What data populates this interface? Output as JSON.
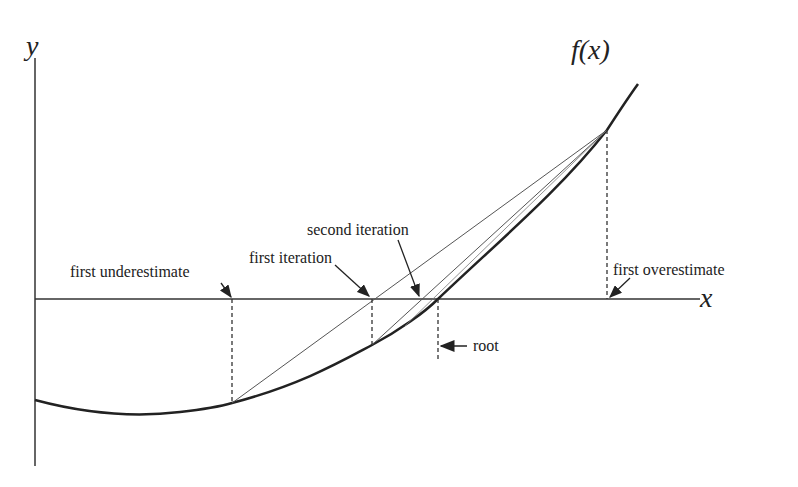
{
  "diagram": {
    "axes": {
      "x_label": "x",
      "y_label": "y"
    },
    "function_label": "f(x)",
    "labels": {
      "first_underestimate": "first underestimate",
      "first_iteration": "first iteration",
      "second_iteration": "second iteration",
      "first_overestimate": "first overestimate",
      "root": "root"
    },
    "points": {
      "underestimate": {
        "x": 232,
        "y_curve": 403
      },
      "first_iteration": {
        "x": 372,
        "y_curve": 345
      },
      "second_iteration": {
        "x": 420
      },
      "root": {
        "x": 438
      },
      "overestimate": {
        "x": 607,
        "y_curve": 130
      }
    },
    "colors": {
      "line": "#222222",
      "secant": "#555555"
    }
  }
}
